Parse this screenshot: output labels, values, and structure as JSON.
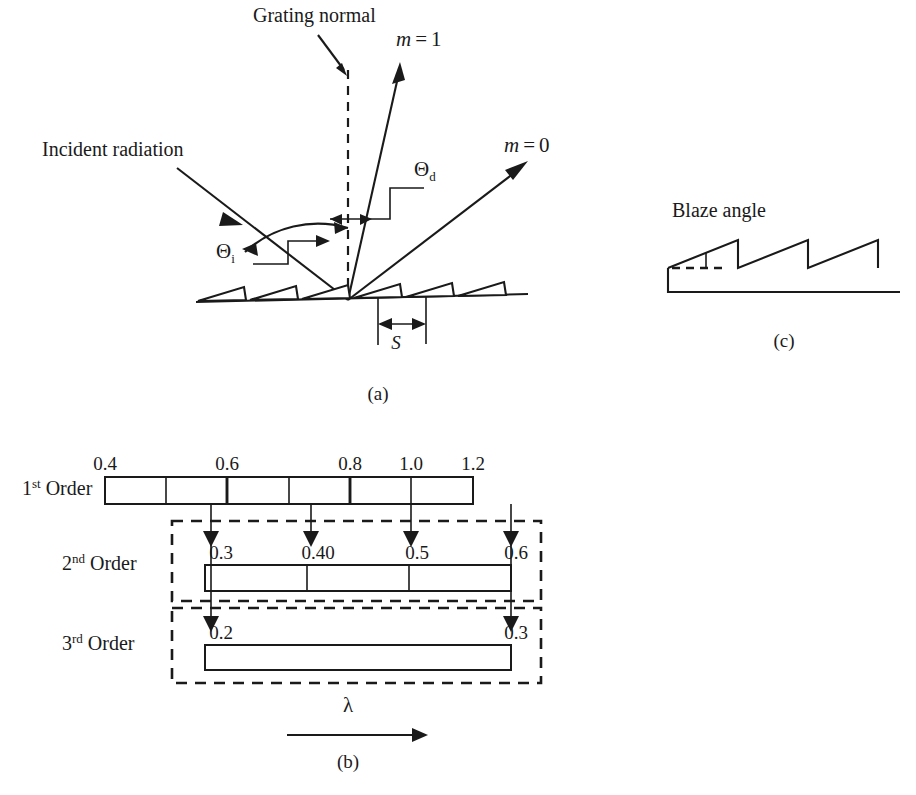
{
  "figure": {
    "panel_a": {
      "id": "(a)",
      "labels": {
        "grating_normal": "Grating normal",
        "incident_radiation": "Incident radiation",
        "order_one": "m = 1",
        "order_one_var": "m",
        "order_one_eq": "=",
        "order_one_val": "1",
        "order_zero_var": "m",
        "order_zero_eq": "=",
        "order_zero_val": "0",
        "theta_i_symbol": "Θ",
        "theta_i_sub": "i",
        "theta_d_symbol": "Θ",
        "theta_d_sub": "d",
        "spacing": "S"
      }
    },
    "panel_b": {
      "id": "(b)",
      "axis_label": "λ",
      "rows": [
        {
          "name": "1st Order",
          "order_number": "1",
          "order_suffix": "st",
          "order_word": "Order",
          "ticks": [
            "0.4",
            "0.6",
            "0.8",
            "1.0",
            "1.2"
          ],
          "segment_count": 6
        },
        {
          "name": "2nd Order",
          "order_number": "2",
          "order_suffix": "nd",
          "order_word": "Order",
          "ticks": [
            "0.3",
            "0.40",
            "0.5",
            "0.6"
          ],
          "segment_count": 3
        },
        {
          "name": "3rd Order",
          "order_number": "3",
          "order_suffix": "rd",
          "order_word": "Order",
          "ticks": [
            "0.2",
            "0.3"
          ],
          "segment_count": 1
        }
      ]
    },
    "panel_c": {
      "id": "(c)",
      "labels": {
        "blaze_angle": "Blaze angle"
      }
    },
    "colors": {
      "ink": "#1a1a1a",
      "background": "#ffffff"
    }
  }
}
